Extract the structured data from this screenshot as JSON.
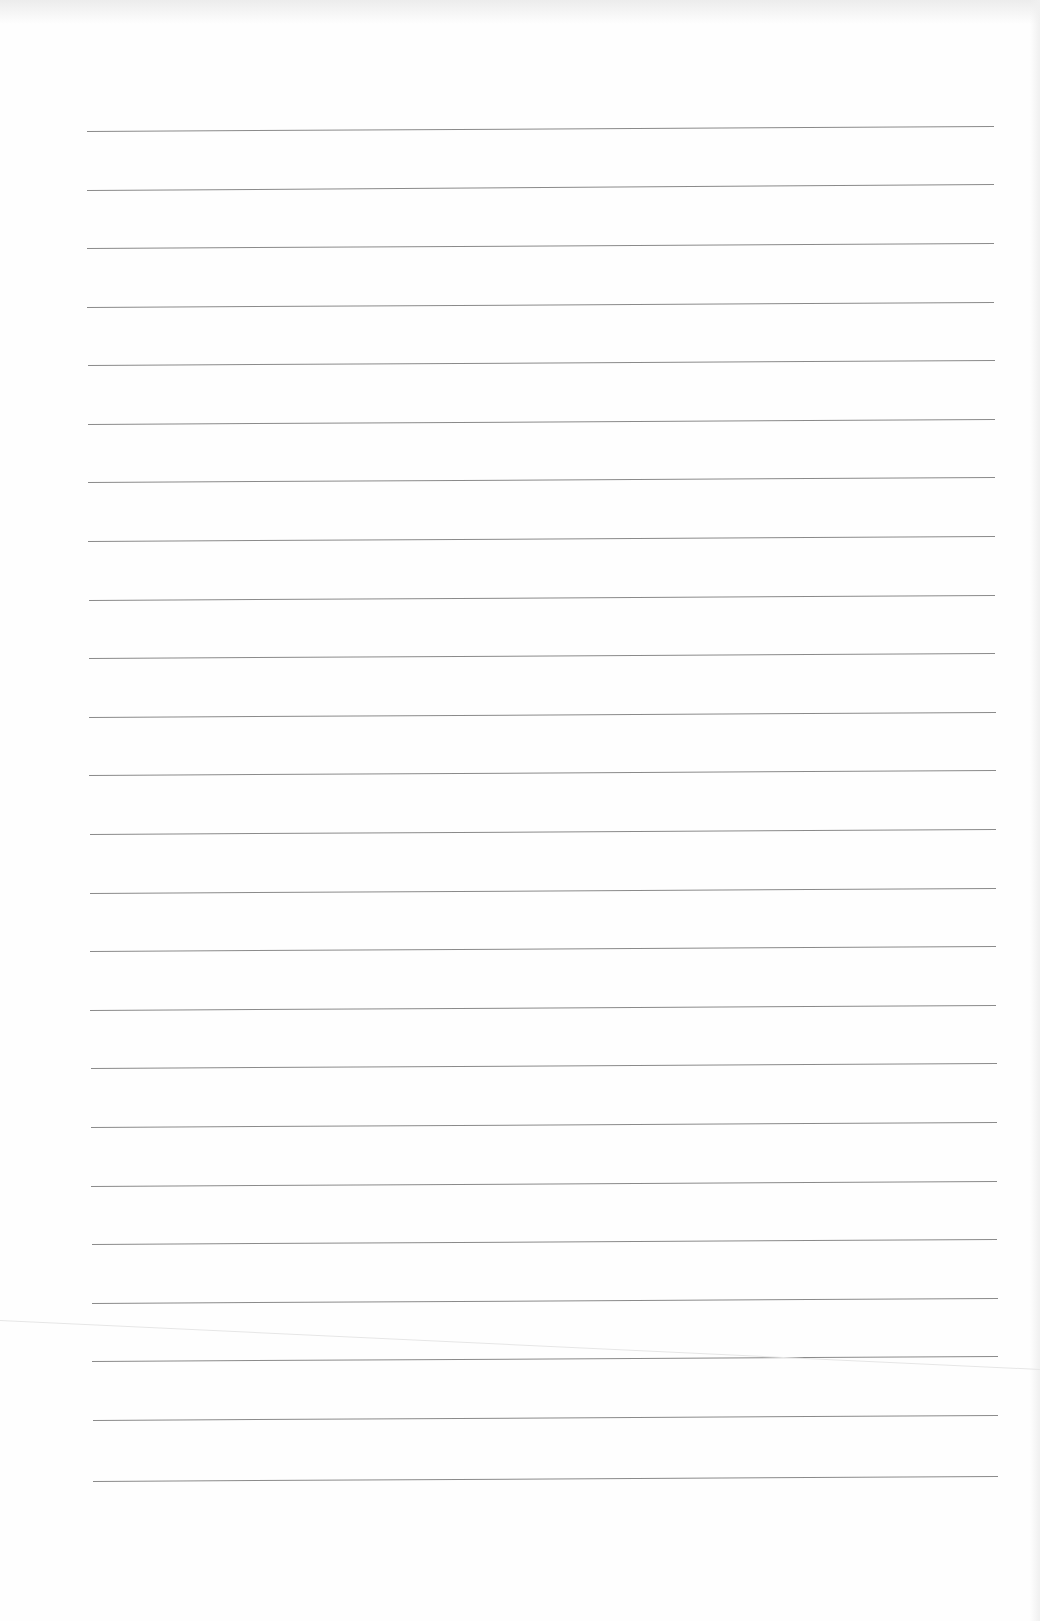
{
  "document": {
    "type": "blank lined paper",
    "line_count": 24,
    "line_color": "#8a8a8a",
    "background_color": "#fefefe",
    "lines": [
      {
        "x1": 87,
        "y1": 131,
        "x2": 994,
        "y2": 126
      },
      {
        "x1": 87,
        "y1": 190,
        "x2": 994,
        "y2": 184
      },
      {
        "x1": 87,
        "y1": 248,
        "x2": 994,
        "y2": 243
      },
      {
        "x1": 87,
        "y1": 307,
        "x2": 994,
        "y2": 302
      },
      {
        "x1": 88,
        "y1": 365,
        "x2": 995,
        "y2": 360
      },
      {
        "x1": 88,
        "y1": 424,
        "x2": 995,
        "y2": 419
      },
      {
        "x1": 88,
        "y1": 482,
        "x2": 995,
        "y2": 477
      },
      {
        "x1": 88,
        "y1": 541,
        "x2": 995,
        "y2": 536
      },
      {
        "x1": 89,
        "y1": 600,
        "x2": 995,
        "y2": 595
      },
      {
        "x1": 89,
        "y1": 658,
        "x2": 995,
        "y2": 653
      },
      {
        "x1": 89,
        "y1": 717,
        "x2": 996,
        "y2": 712
      },
      {
        "x1": 89,
        "y1": 775,
        "x2": 996,
        "y2": 770
      },
      {
        "x1": 90,
        "y1": 834,
        "x2": 996,
        "y2": 829
      },
      {
        "x1": 90,
        "y1": 893,
        "x2": 996,
        "y2": 888
      },
      {
        "x1": 90,
        "y1": 951,
        "x2": 996,
        "y2": 946
      },
      {
        "x1": 90,
        "y1": 1010,
        "x2": 996,
        "y2": 1005
      },
      {
        "x1": 91,
        "y1": 1068,
        "x2": 997,
        "y2": 1063
      },
      {
        "x1": 91,
        "y1": 1127,
        "x2": 997,
        "y2": 1122
      },
      {
        "x1": 91,
        "y1": 1186,
        "x2": 997,
        "y2": 1181
      },
      {
        "x1": 92,
        "y1": 1244,
        "x2": 997,
        "y2": 1239
      },
      {
        "x1": 92,
        "y1": 1303,
        "x2": 998,
        "y2": 1298
      },
      {
        "x1": 92,
        "y1": 1361,
        "x2": 998,
        "y2": 1356
      },
      {
        "x1": 93,
        "y1": 1420,
        "x2": 998,
        "y2": 1415
      },
      {
        "x1": 93,
        "y1": 1481,
        "x2": 998,
        "y2": 1476
      }
    ],
    "crease": {
      "x1": 0,
      "y1": 1320,
      "x2": 1040,
      "y2": 1369
    }
  }
}
